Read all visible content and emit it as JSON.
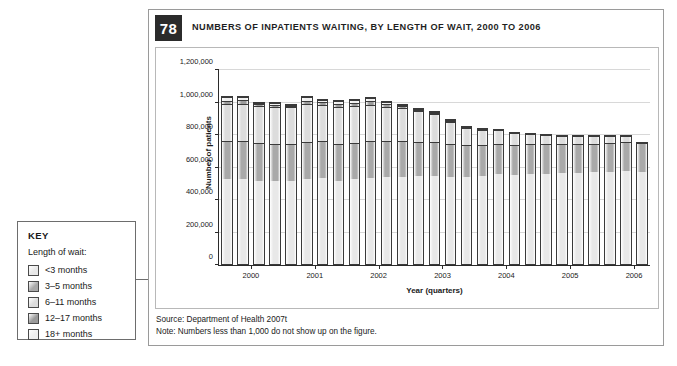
{
  "key": {
    "title": "KEY",
    "subtitle": "Length of wait:",
    "items": [
      {
        "label": "<3 months",
        "color": "#e8e8e8"
      },
      {
        "label": "3–5 months",
        "color": "#a9a9a9"
      },
      {
        "label": "6–11 months",
        "color": "#dcdcdc"
      },
      {
        "label": "12–17 months",
        "color": "#9a9a9a"
      },
      {
        "label": "18+ months",
        "color": "#efefef"
      }
    ]
  },
  "figure": {
    "number": "78",
    "title": "NUMBERS OF INPATIENTS WAITING, BY LENGTH OF WAIT, 2000 TO 2006",
    "source": "Source: Department of Health 2007t",
    "note": "Note: Numbers less than 1,000 do not show up on the figure."
  },
  "chart_data": {
    "type": "bar",
    "stacked": true,
    "title": "NUMBERS OF INPATIENTS WAITING, BY LENGTH OF WAIT, 2000 TO 2006",
    "xlabel": "Year (quarters)",
    "ylabel": "Number of patients",
    "ylim": [
      0,
      1200000
    ],
    "ytick_step": 200000,
    "ytick_labels": [
      "0",
      "200,000",
      "400,000",
      "600,000",
      "800,000",
      "1,000,000",
      "1,200,000"
    ],
    "grid": true,
    "legend_position": "external-left",
    "xtick_labels": [
      "2000",
      "2001",
      "2002",
      "2003",
      "2004",
      "2005",
      "2006"
    ],
    "categories": [
      "2000 Q1",
      "2000 Q2",
      "2000 Q3",
      "2000 Q4",
      "2001 Q1",
      "2001 Q2",
      "2001 Q3",
      "2001 Q4",
      "2002 Q1",
      "2002 Q2",
      "2002 Q3",
      "2002 Q4",
      "2003 Q1",
      "2003 Q2",
      "2003 Q3",
      "2003 Q4",
      "2004 Q1",
      "2004 Q2",
      "2004 Q3",
      "2004 Q4",
      "2005 Q1",
      "2005 Q2",
      "2005 Q3",
      "2005 Q4",
      "2006 Q1",
      "2006 Q2",
      "2006 Q3"
    ],
    "series": [
      {
        "name": "<3 months",
        "color": "#e8e8e8",
        "values": [
          530000,
          528000,
          520000,
          515000,
          520000,
          530000,
          535000,
          520000,
          528000,
          535000,
          540000,
          545000,
          548000,
          552000,
          548000,
          545000,
          555000,
          560000,
          558000,
          562000,
          565000,
          570000,
          572000,
          575000,
          578000,
          580000,
          578000
        ]
      },
      {
        "name": "3–5 months",
        "color": "#a9a9a9",
        "values": [
          238000,
          240000,
          235000,
          232000,
          230000,
          232000,
          230000,
          225000,
          228000,
          230000,
          225000,
          222000,
          215000,
          212000,
          208000,
          200000,
          195000,
          190000,
          188000,
          185000,
          182000,
          180000,
          180000,
          178000,
          180000,
          180000,
          182000
        ]
      },
      {
        "name": "6–11 months",
        "color": "#dcdcdc",
        "values": [
          228000,
          230000,
          228000,
          232000,
          230000,
          232000,
          228000,
          232000,
          230000,
          228000,
          215000,
          205000,
          190000,
          175000,
          135000,
          110000,
          95000,
          85000,
          72000,
          65000,
          58000,
          52000,
          48000,
          45000,
          42000,
          40000,
          0
        ]
      },
      {
        "name": "12–17 months",
        "color": "#9a9a9a",
        "values": [
          22000,
          24000,
          12000,
          14000,
          8000,
          24000,
          14000,
          22000,
          20000,
          22000,
          18000,
          10000,
          8000,
          6000,
          4000,
          2000,
          1000,
          0,
          0,
          0,
          0,
          0,
          0,
          0,
          0,
          0,
          0
        ]
      },
      {
        "name": "18+ months",
        "color": "#efefef",
        "values": [
          22000,
          20000,
          10000,
          12000,
          5000,
          20000,
          12000,
          18000,
          18000,
          20000,
          12000,
          6000,
          4000,
          2000,
          1000,
          0,
          0,
          0,
          0,
          0,
          0,
          0,
          0,
          0,
          0,
          0,
          0
        ]
      }
    ]
  }
}
